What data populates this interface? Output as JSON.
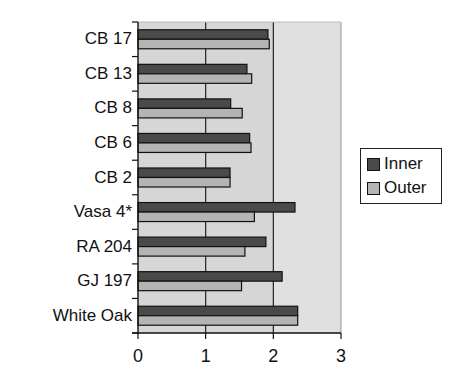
{
  "chart_data": {
    "type": "bar",
    "orientation": "horizontal",
    "title": "",
    "xlabel": "",
    "ylabel": "",
    "xlim": [
      0,
      3
    ],
    "xticks": [
      "0",
      "1",
      "2",
      "3"
    ],
    "grid": "vertical major gridlines",
    "legend_position": "right",
    "categories": [
      "CB 17",
      "CB 13",
      "CB 8",
      "CB 6",
      "CB 2",
      "Vasa 4*",
      "RA 204",
      "GJ 197",
      "White Oak"
    ],
    "series": [
      {
        "name": "Inner",
        "color": "#4a4a4a",
        "values": [
          1.92,
          1.61,
          1.37,
          1.65,
          1.36,
          2.32,
          1.89,
          2.13,
          2.36
        ]
      },
      {
        "name": "Outer",
        "color": "#b4b4b4",
        "values": [
          1.94,
          1.68,
          1.54,
          1.67,
          1.36,
          1.72,
          1.58,
          1.53,
          2.36
        ]
      }
    ]
  },
  "style": {
    "plot_bg": "#d6d6d6",
    "plot_bg_outer": "#e0e0e0",
    "gridline": "#222222"
  },
  "legend": {
    "items": [
      {
        "label": "Inner",
        "color": "#4a4a4a"
      },
      {
        "label": "Outer",
        "color": "#b4b4b4"
      }
    ]
  }
}
